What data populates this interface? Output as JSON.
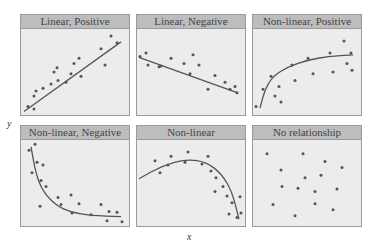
{
  "colors": {
    "header_bg": "#bdbdbd",
    "plot_bg": "#ececec",
    "border": "#9a9a9a",
    "point": "#555555",
    "line": "#555555"
  },
  "axes": {
    "xlabel": "x",
    "ylabel": "y"
  },
  "chart_data": [
    {
      "type": "scatter",
      "title": "Linear, Positive",
      "trend": "linear",
      "points": [
        [
          7,
          10
        ],
        [
          13,
          22
        ],
        [
          13,
          7
        ],
        [
          15,
          28
        ],
        [
          22,
          31
        ],
        [
          30,
          36
        ],
        [
          33,
          50
        ],
        [
          36,
          55
        ],
        [
          37,
          40
        ],
        [
          45,
          38
        ],
        [
          50,
          48
        ],
        [
          53,
          60
        ],
        [
          58,
          66
        ],
        [
          60,
          45
        ],
        [
          80,
          77
        ],
        [
          84,
          58
        ],
        [
          90,
          92
        ],
        [
          96,
          84
        ]
      ],
      "curve": [
        [
          3,
          4
        ],
        [
          100,
          85
        ]
      ]
    },
    {
      "type": "scatter",
      "title": "Linear, Negative",
      "trend": "linear",
      "points": [
        [
          3,
          68
        ],
        [
          9,
          72
        ],
        [
          11,
          58
        ],
        [
          22,
          56
        ],
        [
          24,
          57
        ],
        [
          34,
          66
        ],
        [
          47,
          60
        ],
        [
          53,
          48
        ],
        [
          56,
          70
        ],
        [
          62,
          58
        ],
        [
          71,
          30
        ],
        [
          78,
          46
        ],
        [
          88,
          38
        ],
        [
          93,
          30
        ],
        [
          98,
          33
        ],
        [
          100,
          26
        ]
      ],
      "curve": [
        [
          2,
          67
        ],
        [
          100,
          26
        ]
      ]
    },
    {
      "type": "scatter",
      "title": "Non-linear, Positive",
      "trend": "logarithmic",
      "points": [
        [
          3,
          10
        ],
        [
          10,
          30
        ],
        [
          18,
          45
        ],
        [
          22,
          22
        ],
        [
          26,
          33
        ],
        [
          28,
          15
        ],
        [
          39,
          58
        ],
        [
          42,
          40
        ],
        [
          55,
          66
        ],
        [
          60,
          48
        ],
        [
          77,
          72
        ],
        [
          80,
          50
        ],
        [
          91,
          86
        ],
        [
          94,
          60
        ],
        [
          98,
          72
        ],
        [
          99,
          52
        ]
      ],
      "curve": [
        [
          7,
          8
        ],
        [
          12,
          30
        ],
        [
          20,
          45
        ],
        [
          35,
          56
        ],
        [
          55,
          64
        ],
        [
          75,
          68
        ],
        [
          100,
          70
        ]
      ]
    },
    {
      "type": "scatter",
      "title": "Non-linear, Negative",
      "trend": "exponential-decay",
      "points": [
        [
          8,
          88
        ],
        [
          14,
          95
        ],
        [
          11,
          62
        ],
        [
          16,
          74
        ],
        [
          20,
          53
        ],
        [
          22,
          71
        ],
        [
          25,
          46
        ],
        [
          19,
          23
        ],
        [
          37,
          33
        ],
        [
          40,
          25
        ],
        [
          51,
          15
        ],
        [
          50,
          36
        ],
        [
          58,
          26
        ],
        [
          70,
          13
        ],
        [
          80,
          25
        ],
        [
          86,
          6
        ],
        [
          88,
          17
        ],
        [
          96,
          16
        ],
        [
          101,
          5
        ]
      ],
      "curve": [
        [
          10,
          92
        ],
        [
          15,
          60
        ],
        [
          22,
          40
        ],
        [
          35,
          24
        ],
        [
          50,
          16
        ],
        [
          70,
          12
        ],
        [
          100,
          11
        ]
      ]
    },
    {
      "type": "scatter",
      "title": "Non-linear",
      "trend": "inverted-u",
      "points": [
        [
          18,
          76
        ],
        [
          23,
          62
        ],
        [
          31,
          71
        ],
        [
          34,
          81
        ],
        [
          51,
          86
        ],
        [
          48,
          74
        ],
        [
          65,
          72
        ],
        [
          71,
          81
        ],
        [
          74,
          64
        ],
        [
          79,
          56
        ],
        [
          86,
          46
        ],
        [
          78,
          40
        ],
        [
          90,
          35
        ],
        [
          95,
          27
        ],
        [
          92,
          14
        ],
        [
          100,
          10
        ],
        [
          103,
          34
        ],
        [
          104,
          15
        ]
      ],
      "curve": [
        [
          2,
          55
        ],
        [
          25,
          70
        ],
        [
          50,
          78
        ],
        [
          70,
          74
        ],
        [
          85,
          60
        ],
        [
          95,
          40
        ],
        [
          102,
          8
        ]
      ]
    },
    {
      "type": "scatter",
      "title": "No relationship",
      "trend": "none",
      "points": [
        [
          14,
          84
        ],
        [
          50,
          84
        ],
        [
          72,
          75
        ],
        [
          28,
          65
        ],
        [
          89,
          68
        ],
        [
          52,
          56
        ],
        [
          68,
          59
        ],
        [
          29,
          46
        ],
        [
          45,
          44
        ],
        [
          62,
          40
        ],
        [
          84,
          43
        ],
        [
          20,
          25
        ],
        [
          62,
          26
        ],
        [
          80,
          19
        ],
        [
          42,
          12
        ]
      ],
      "curve": []
    }
  ]
}
